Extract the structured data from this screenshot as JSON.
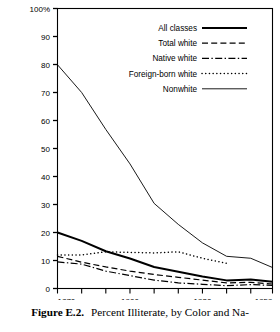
{
  "caption": {
    "figure_label": "Figure E.2.",
    "text": "Percent Illiterate, by Color and Na-"
  },
  "chart_data": {
    "type": "line",
    "title": "",
    "subtitle": "",
    "xlabel": "",
    "ylabel": "",
    "xlim": [
      1870,
      1959
    ],
    "ylim": [
      0,
      100
    ],
    "grid": false,
    "legend_position": "top-right",
    "y_top_label": "100%",
    "y_ticks": [
      0,
      10,
      20,
      30,
      40,
      50,
      60,
      70,
      80,
      90,
      100
    ],
    "y_tick_labels": [
      "0",
      "10",
      "20",
      "30",
      "40",
      "50",
      "60",
      "70",
      "80",
      "90",
      "100%"
    ],
    "x_ticks": [
      1870,
      1880,
      1890,
      1900,
      1910,
      1920,
      1930,
      1940,
      1950,
      1959
    ],
    "x_tick_labels_shown": [
      "1870",
      "1900",
      "1930",
      "1959"
    ],
    "x_labeled_ticks": [
      1870,
      1900,
      1930,
      1959
    ],
    "series": [
      {
        "name": "All classes",
        "style": "solid-thick",
        "x": [
          1870,
          1880,
          1890,
          1900,
          1910,
          1920,
          1930,
          1940,
          1950,
          1959
        ],
        "values": [
          20.0,
          17.0,
          13.3,
          10.7,
          7.7,
          6.0,
          4.3,
          2.9,
          3.2,
          2.4
        ]
      },
      {
        "name": "Total white",
        "style": "dashed",
        "x": [
          1870,
          1880,
          1890,
          1900,
          1910,
          1920,
          1930,
          1940,
          1950,
          1959
        ],
        "values": [
          11.5,
          9.4,
          7.7,
          6.2,
          5.0,
          4.0,
          3.0,
          2.0,
          2.2,
          1.6
        ]
      },
      {
        "name": "Native white",
        "style": "dash-dot",
        "x": [
          1870,
          1880,
          1890,
          1900,
          1910,
          1920,
          1930,
          1940,
          1950,
          1959
        ],
        "values": [
          9.5,
          8.7,
          6.2,
          4.6,
          3.0,
          2.0,
          1.5,
          1.0,
          1.4,
          1.1
        ]
      },
      {
        "name": "Foreign-born white",
        "style": "dotted",
        "x": [
          1870,
          1880,
          1890,
          1900,
          1910,
          1920,
          1930,
          1940
        ],
        "values": [
          12.0,
          12.0,
          13.1,
          12.9,
          12.7,
          13.1,
          10.8,
          9.0
        ]
      },
      {
        "name": "Nonwhite",
        "style": "solid-thin",
        "x": [
          1870,
          1880,
          1890,
          1900,
          1910,
          1920,
          1930,
          1940,
          1950,
          1959
        ],
        "values": [
          79.9,
          70.0,
          56.8,
          44.5,
          30.4,
          22.9,
          16.3,
          11.5,
          10.8,
          7.5
        ]
      }
    ]
  },
  "legend": {
    "entries": [
      {
        "label": "All classes",
        "style": "solid-thick"
      },
      {
        "label": "Total white",
        "style": "dashed"
      },
      {
        "label": "Native white",
        "style": "dash-dot"
      },
      {
        "label": "Foreign-born white",
        "style": "dotted"
      },
      {
        "label": "Nonwhite",
        "style": "solid-thin"
      }
    ]
  }
}
